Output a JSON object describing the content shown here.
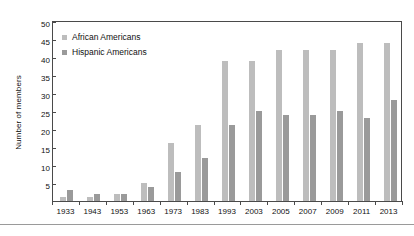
{
  "chart_data": {
    "type": "bar",
    "title": "",
    "xlabel": "",
    "ylabel": "Number of members",
    "ylim": [
      0,
      50
    ],
    "yticks": [
      0,
      5,
      10,
      15,
      20,
      25,
      30,
      35,
      40,
      45,
      50
    ],
    "ytick_labels": [
      "",
      "5",
      "10",
      "15",
      "20",
      "25",
      "30",
      "35",
      "40",
      "45",
      "50"
    ],
    "grid": false,
    "legend_position": "upper-left",
    "categories": [
      "1933",
      "1943",
      "1953",
      "1963",
      "1973",
      "1983",
      "1993",
      "2003",
      "2005",
      "2007",
      "2009",
      "2011",
      "2013"
    ],
    "series": [
      {
        "name": "African Americans",
        "color": "#bdbdbd",
        "values": [
          1,
          1,
          2,
          5,
          16,
          21,
          39,
          39,
          42,
          42,
          42,
          44,
          44
        ]
      },
      {
        "name": "Hispanic Americans",
        "color": "#9a9a9a",
        "values": [
          3,
          2,
          2,
          4,
          8,
          12,
          21,
          25,
          24,
          24,
          25,
          23,
          28
        ]
      }
    ]
  },
  "legend": {
    "items": [
      {
        "label": "African Americans",
        "color": "#bdbdbd"
      },
      {
        "label": "Hispanic Americans",
        "color": "#9a9a9a"
      }
    ]
  }
}
